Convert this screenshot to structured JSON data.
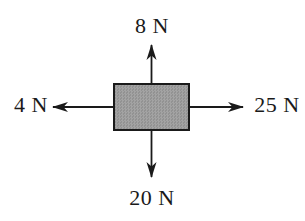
{
  "diagram": {
    "kind": "free-body-diagram",
    "object": "rectangular block",
    "forces": {
      "up": {
        "label": "8 N",
        "magnitude": 8,
        "unit": "N",
        "direction": "up"
      },
      "left": {
        "label": "4 N",
        "magnitude": 4,
        "unit": "N",
        "direction": "left"
      },
      "right": {
        "label": "25 N",
        "magnitude": 25,
        "unit": "N",
        "direction": "right"
      },
      "down": {
        "label": "20 N",
        "magnitude": 20,
        "unit": "N",
        "direction": "down"
      }
    },
    "colors": {
      "background": "#ffffff",
      "block_fill": "#9a9a9a",
      "block_border": "#1a1a1a",
      "arrow": "#1a1a1a",
      "text": "#1a1a1a"
    }
  }
}
